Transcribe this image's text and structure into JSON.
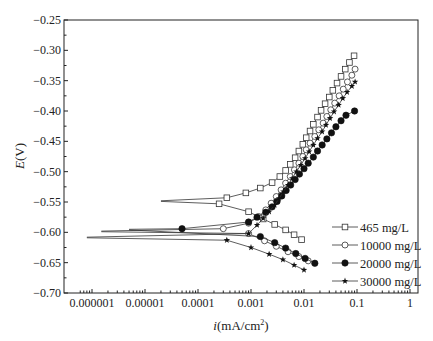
{
  "chart_data": {
    "type": "line",
    "title": "",
    "xlabel": "i(mA/cm²)",
    "ylabel": "E(V)",
    "xscale": "log",
    "xlim": [
      5e-07,
      1.5
    ],
    "ylim": [
      -0.7,
      -0.25
    ],
    "xticks": [
      "0.000001",
      "0.00001",
      "0.0001",
      "0.001",
      "0.01",
      "0.1",
      "1"
    ],
    "yticks": [
      "-0.25",
      "-0.30",
      "-0.35",
      "-0.40",
      "-0.45",
      "-0.50",
      "-0.55",
      "-0.60",
      "-0.65",
      "-0.70"
    ],
    "grid": false,
    "legend_position": "lower right",
    "series": [
      {
        "name": "465 mg/L",
        "marker": "square-open",
        "ecorr": -0.548,
        "tail_start": 2e-05,
        "anodic": [
          [
            0.00035,
            -0.543
          ],
          [
            0.0008,
            -0.535
          ],
          [
            0.0015,
            -0.527
          ],
          [
            0.0025,
            -0.518
          ],
          [
            0.0035,
            -0.508
          ],
          [
            0.0045,
            -0.498
          ],
          [
            0.0055,
            -0.488
          ],
          [
            0.0068,
            -0.477
          ],
          [
            0.008,
            -0.466
          ],
          [
            0.0095,
            -0.455
          ],
          [
            0.011,
            -0.444
          ],
          [
            0.013,
            -0.433
          ],
          [
            0.015,
            -0.422
          ],
          [
            0.018,
            -0.41
          ],
          [
            0.021,
            -0.399
          ],
          [
            0.025,
            -0.388
          ],
          [
            0.03,
            -0.377
          ],
          [
            0.035,
            -0.366
          ],
          [
            0.042,
            -0.354
          ],
          [
            0.05,
            -0.343
          ],
          [
            0.06,
            -0.331
          ],
          [
            0.072,
            -0.32
          ],
          [
            0.088,
            -0.309
          ]
        ],
        "cathodic": [
          [
            0.00025,
            -0.553
          ],
          [
            0.0009,
            -0.566
          ],
          [
            0.0017,
            -0.578
          ],
          [
            0.0028,
            -0.587
          ],
          [
            0.0045,
            -0.596
          ],
          [
            0.0065,
            -0.604
          ],
          [
            0.009,
            -0.612
          ]
        ]
      },
      {
        "name": "10000 mg/L",
        "marker": "circle-open",
        "ecorr": -0.598,
        "tail_start": 1.5e-06,
        "anodic": [
          [
            0.0003,
            -0.594
          ],
          [
            0.0009,
            -0.585
          ],
          [
            0.0014,
            -0.574
          ],
          [
            0.0019,
            -0.563
          ],
          [
            0.0024,
            -0.552
          ],
          [
            0.003,
            -0.541
          ],
          [
            0.0037,
            -0.53
          ],
          [
            0.0045,
            -0.519
          ],
          [
            0.0055,
            -0.508
          ],
          [
            0.0066,
            -0.497
          ],
          [
            0.008,
            -0.486
          ],
          [
            0.0095,
            -0.475
          ],
          [
            0.011,
            -0.464
          ],
          [
            0.013,
            -0.453
          ],
          [
            0.016,
            -0.442
          ],
          [
            0.019,
            -0.431
          ],
          [
            0.023,
            -0.42
          ],
          [
            0.027,
            -0.409
          ],
          [
            0.032,
            -0.398
          ],
          [
            0.038,
            -0.387
          ],
          [
            0.046,
            -0.375
          ],
          [
            0.055,
            -0.364
          ],
          [
            0.066,
            -0.352
          ],
          [
            0.08,
            -0.341
          ],
          [
            0.092,
            -0.331
          ]
        ],
        "cathodic": [
          [
            0.0009,
            -0.602
          ],
          [
            0.0018,
            -0.614
          ],
          [
            0.003,
            -0.623
          ],
          [
            0.005,
            -0.632
          ],
          [
            0.008,
            -0.64
          ],
          [
            0.012,
            -0.647
          ]
        ]
      },
      {
        "name": "20000 mg/L",
        "marker": "circle-filled",
        "ecorr": -0.595,
        "tail_start": 5e-06,
        "anodic": [
          [
            5e-05,
            -0.594
          ],
          [
            0.0009,
            -0.583
          ],
          [
            0.0013,
            -0.575
          ],
          [
            0.0019,
            -0.567
          ],
          [
            0.0025,
            -0.558
          ],
          [
            0.0031,
            -0.549
          ],
          [
            0.0038,
            -0.54
          ],
          [
            0.0046,
            -0.531
          ],
          [
            0.0056,
            -0.522
          ],
          [
            0.0068,
            -0.513
          ],
          [
            0.0082,
            -0.504
          ],
          [
            0.01,
            -0.495
          ],
          [
            0.012,
            -0.486
          ],
          [
            0.015,
            -0.476
          ],
          [
            0.018,
            -0.466
          ],
          [
            0.022,
            -0.456
          ],
          [
            0.027,
            -0.446
          ],
          [
            0.033,
            -0.436
          ],
          [
            0.04,
            -0.426
          ],
          [
            0.05,
            -0.416
          ],
          [
            0.062,
            -0.407
          ],
          [
            0.09,
            -0.4
          ]
        ],
        "cathodic": [
          [
            0.0015,
            -0.607
          ],
          [
            0.0028,
            -0.617
          ],
          [
            0.0045,
            -0.626
          ],
          [
            0.007,
            -0.635
          ],
          [
            0.0105,
            -0.643
          ],
          [
            0.016,
            -0.651
          ]
        ]
      },
      {
        "name": "30000 mg/L",
        "marker": "star",
        "ecorr": -0.608,
        "tail_start": 8e-07,
        "anodic": [
          [
            0.0009,
            -0.602
          ],
          [
            0.0013,
            -0.588
          ],
          [
            0.0017,
            -0.577
          ],
          [
            0.0022,
            -0.566
          ],
          [
            0.0028,
            -0.555
          ],
          [
            0.0034,
            -0.544
          ],
          [
            0.0041,
            -0.533
          ],
          [
            0.005,
            -0.522
          ],
          [
            0.006,
            -0.511
          ],
          [
            0.0072,
            -0.5
          ],
          [
            0.0087,
            -0.489
          ],
          [
            0.0105,
            -0.478
          ],
          [
            0.0125,
            -0.467
          ],
          [
            0.015,
            -0.456
          ],
          [
            0.018,
            -0.445
          ],
          [
            0.022,
            -0.434
          ],
          [
            0.026,
            -0.423
          ],
          [
            0.031,
            -0.412
          ],
          [
            0.037,
            -0.401
          ],
          [
            0.045,
            -0.39
          ],
          [
            0.054,
            -0.379
          ],
          [
            0.065,
            -0.369
          ],
          [
            0.08,
            -0.359
          ],
          [
            0.092,
            -0.352
          ]
        ],
        "cathodic": [
          [
            0.00035,
            -0.613
          ],
          [
            0.001,
            -0.625
          ],
          [
            0.0022,
            -0.636
          ],
          [
            0.004,
            -0.645
          ],
          [
            0.0065,
            -0.654
          ],
          [
            0.01,
            -0.662
          ]
        ]
      }
    ]
  },
  "legend": {
    "items": [
      {
        "label": "465 mg/L"
      },
      {
        "label": "10000 mg/L"
      },
      {
        "label": "20000 mg/L"
      },
      {
        "label": "30000 mg/L"
      }
    ]
  },
  "axes": {
    "xlabel_i": "i",
    "xlabel_rest": "(mA/cm",
    "xlabel_sup": "2",
    "xlabel_close": ")",
    "ylabel_e": "E",
    "ylabel_rest": "(V)"
  }
}
